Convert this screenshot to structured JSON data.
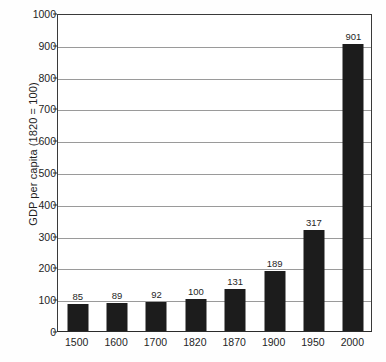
{
  "chart_data": {
    "type": "bar",
    "title": "",
    "xlabel": "",
    "ylabel": "GDP per capita (1820 = 100)",
    "categories": [
      "1500",
      "1600",
      "1700",
      "1820",
      "1870",
      "1900",
      "1950",
      "2000"
    ],
    "values": [
      85,
      89,
      92,
      100,
      131,
      189,
      317,
      901
    ],
    "value_labels": [
      "85",
      "89",
      "92",
      "100",
      "131",
      "189",
      "317",
      "901"
    ],
    "ylim": [
      0,
      1000
    ],
    "ytick_labels": [
      "0",
      "100",
      "200",
      "300",
      "400",
      "500",
      "600",
      "700",
      "800",
      "900",
      "1000"
    ],
    "ytick_values": [
      0,
      100,
      200,
      300,
      400,
      500,
      600,
      700,
      800,
      900,
      1000
    ],
    "grid": true,
    "legend": "none",
    "colors": {
      "bar": "#1c1c1c",
      "grid": "#9a9a9a",
      "axis": "#2b2b2b",
      "text": "#1f1f1f",
      "background": "#ffffff"
    }
  }
}
